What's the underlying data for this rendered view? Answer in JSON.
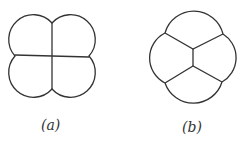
{
  "figures": [
    {
      "label": "(a)",
      "description": "four-cell cluster arranged 2x2"
    },
    {
      "label": "(b)",
      "description": "four-cell cluster with central vertical wall and two Y-junctions"
    }
  ],
  "colors": {
    "stroke": "#333333",
    "background": "#ffffff"
  }
}
